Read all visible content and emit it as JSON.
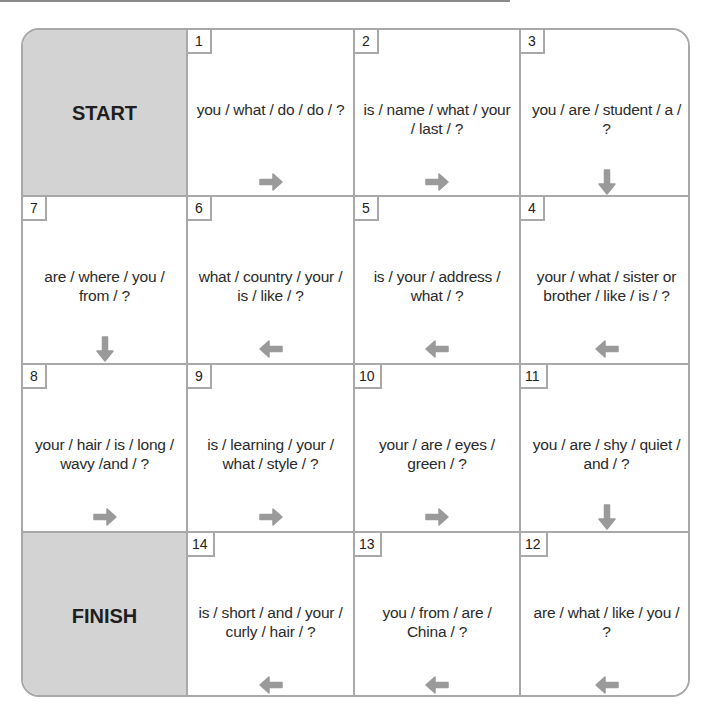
{
  "board": {
    "start_label": "START",
    "finish_label": "FINISH",
    "colors": {
      "shaded": "#d3d3d3",
      "border": "#a8a8a8",
      "arrow": "#9a9a9a"
    },
    "squares": [
      {
        "number": "1",
        "text": "you / what / do / do / ?",
        "arrow": "right"
      },
      {
        "number": "2",
        "text": "is / name / what / your / last / ?",
        "arrow": "right"
      },
      {
        "number": "3",
        "text": "you / are / student / a / ?",
        "arrow": "down"
      },
      {
        "number": "4",
        "text": "your / what / sister or brother / like / is / ?",
        "arrow": "left"
      },
      {
        "number": "5",
        "text": "is / your / address / what / ?",
        "arrow": "left"
      },
      {
        "number": "6",
        "text": "what / country / your / is / like / ?",
        "arrow": "left"
      },
      {
        "number": "7",
        "text": "are / where / you / from / ?",
        "arrow": "down"
      },
      {
        "number": "8",
        "text": "your / hair / is / long / wavy /and / ?",
        "arrow": "right"
      },
      {
        "number": "9",
        "text": "is / learning / your / what / style / ?",
        "arrow": "right"
      },
      {
        "number": "10",
        "text": "your / are / eyes / green / ?",
        "arrow": "right"
      },
      {
        "number": "11",
        "text": "you / are / shy / quiet / and / ?",
        "arrow": "down"
      },
      {
        "number": "12",
        "text": "are / what / like / you / ?",
        "arrow": "left"
      },
      {
        "number": "13",
        "text": "you / from / are / China / ?",
        "arrow": "left"
      },
      {
        "number": "14",
        "text": "is / short / and / your / curly / hair / ?",
        "arrow": "left"
      }
    ]
  }
}
